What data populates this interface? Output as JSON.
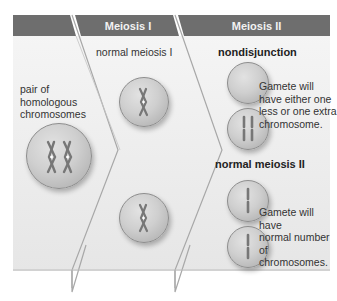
{
  "headers": {
    "col0": "",
    "meiosis_1": "Meiosis I",
    "meiosis_2": "Meiosis II"
  },
  "labels": {
    "pair_of_homologous": [
      "pair of",
      "homologous",
      "chromosomes"
    ],
    "normal_meiosis_1": "normal meiosis I",
    "nondisjunction": "nondisjunction",
    "nondisjunction_desc": [
      "Gamete will",
      "have either one",
      "less or one extra",
      "chromosome."
    ],
    "normal_meiosis_2": "normal meiosis II",
    "normal_desc": [
      "Gamete will have",
      "normal number",
      "of chromosomes."
    ]
  },
  "colors": {
    "header_bg": "#6e6e6e",
    "panel_bg": "#ececec",
    "divider": "#a8a8a8",
    "cell_fill": "#cfcfcf",
    "chromosome": "#7a7a7a"
  },
  "icons": {
    "homologous_pair_cell": "cell-with-two-x-chromosomes",
    "meiosis1_cell_top": "cell-with-one-x-chromosome",
    "meiosis1_cell_bottom": "cell-with-one-x-chromosome",
    "nondisjunction_cell_empty": "empty-cell",
    "nondisjunction_cell_double": "cell-with-two-chromatids",
    "normal2_cell_top": "cell-with-single-chromatid",
    "normal2_cell_bottom": "cell-with-single-chromatid"
  }
}
